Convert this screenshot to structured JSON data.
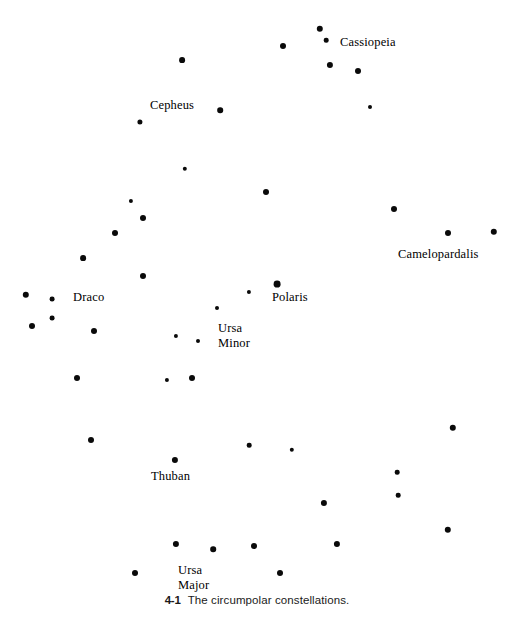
{
  "figure": {
    "title": "The circumpolar constellations",
    "number": "4-1",
    "caption_text": "The circumpolar constellations.",
    "background_color": "#ffffff",
    "star_color": "#0a0a0a",
    "width": 514,
    "height": 629
  },
  "labels": {
    "cassiopeia": "Cassiopeia",
    "cepheus": "Cepheus",
    "camelopardalis": "Camelopardalis",
    "draco": "Draco",
    "polaris": "Polaris",
    "ursa_minor_line1": "Ursa",
    "ursa_minor_line2": "Minor",
    "thuban": "Thuban",
    "ursa_major_line1": "Ursa",
    "ursa_major_line2": "Major"
  },
  "chart_data": {
    "type": "scatter",
    "title": "The circumpolar constellations.",
    "xlabel": "",
    "ylabel": "",
    "xlim": [
      0,
      514
    ],
    "ylim": [
      0,
      629
    ],
    "grid": false,
    "legend": "none",
    "note": "Star map: dot size encodes apparent brightness (magnitude). x/y are pixel positions measured from the top-left of the figure; r is the plotted dot radius in pixels.",
    "annotations": [
      {
        "text": "Cassiopeia",
        "x": 340,
        "y": 42
      },
      {
        "text": "Cepheus",
        "x": 150,
        "y": 105
      },
      {
        "text": "Camelopardalis",
        "x": 398,
        "y": 254
      },
      {
        "text": "Draco",
        "x": 73,
        "y": 297
      },
      {
        "text": "Polaris",
        "x": 272,
        "y": 297
      },
      {
        "text": "Ursa Minor",
        "x": 218,
        "y": 328
      },
      {
        "text": "Thuban",
        "x": 151,
        "y": 476
      },
      {
        "text": "Ursa Major",
        "x": 178,
        "y": 570
      }
    ],
    "stars": [
      {
        "x": 320,
        "y": 29,
        "r": 3.2
      },
      {
        "x": 283,
        "y": 46,
        "r": 3.0
      },
      {
        "x": 326,
        "y": 40,
        "r": 2.3
      },
      {
        "x": 330,
        "y": 65,
        "r": 3.1
      },
      {
        "x": 358,
        "y": 71,
        "r": 3.0
      },
      {
        "x": 370,
        "y": 107,
        "r": 2.0
      },
      {
        "x": 182,
        "y": 60,
        "r": 2.9
      },
      {
        "x": 220,
        "y": 110,
        "r": 2.8
      },
      {
        "x": 140,
        "y": 122,
        "r": 2.6
      },
      {
        "x": 185,
        "y": 169,
        "r": 2.2
      },
      {
        "x": 266,
        "y": 192,
        "r": 3.0
      },
      {
        "x": 394,
        "y": 209,
        "r": 3.0
      },
      {
        "x": 448,
        "y": 233,
        "r": 3.0
      },
      {
        "x": 494,
        "y": 232,
        "r": 3.2
      },
      {
        "x": 131,
        "y": 201,
        "r": 2.1
      },
      {
        "x": 143,
        "y": 218,
        "r": 3.0
      },
      {
        "x": 115,
        "y": 233,
        "r": 3.0
      },
      {
        "x": 83,
        "y": 258,
        "r": 2.9
      },
      {
        "x": 143,
        "y": 276,
        "r": 3.0
      },
      {
        "x": 26,
        "y": 295,
        "r": 3.2
      },
      {
        "x": 52,
        "y": 299,
        "r": 2.4
      },
      {
        "x": 52,
        "y": 318,
        "r": 2.4
      },
      {
        "x": 32,
        "y": 326,
        "r": 3.0
      },
      {
        "x": 94,
        "y": 331,
        "r": 3.0
      },
      {
        "x": 77,
        "y": 378,
        "r": 3.0
      },
      {
        "x": 176,
        "y": 336,
        "r": 2.1
      },
      {
        "x": 167,
        "y": 380,
        "r": 2.1
      },
      {
        "x": 192,
        "y": 378,
        "r": 3.0
      },
      {
        "x": 277,
        "y": 284,
        "r": 3.4
      },
      {
        "x": 249,
        "y": 292,
        "r": 2.1
      },
      {
        "x": 217,
        "y": 308,
        "r": 2.0
      },
      {
        "x": 198,
        "y": 341,
        "r": 2.0
      },
      {
        "x": 91,
        "y": 440,
        "r": 3.0
      },
      {
        "x": 175,
        "y": 460,
        "r": 3.1
      },
      {
        "x": 249,
        "y": 445,
        "r": 2.3
      },
      {
        "x": 292,
        "y": 450,
        "r": 2.2
      },
      {
        "x": 453,
        "y": 428,
        "r": 3.2
      },
      {
        "x": 397,
        "y": 472,
        "r": 2.3
      },
      {
        "x": 398,
        "y": 495,
        "r": 2.3
      },
      {
        "x": 324,
        "y": 503,
        "r": 3.1
      },
      {
        "x": 448,
        "y": 530,
        "r": 3.2
      },
      {
        "x": 337,
        "y": 544,
        "r": 3.1
      },
      {
        "x": 176,
        "y": 544,
        "r": 3.1
      },
      {
        "x": 213,
        "y": 549,
        "r": 2.8
      },
      {
        "x": 254,
        "y": 546,
        "r": 3.0
      },
      {
        "x": 135,
        "y": 573,
        "r": 3.0
      },
      {
        "x": 280,
        "y": 573,
        "r": 3.0
      }
    ]
  }
}
